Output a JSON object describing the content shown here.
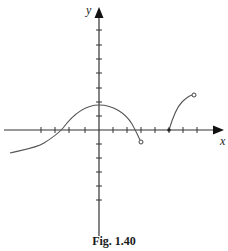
{
  "figure": {
    "caption": "Fig. 1.40",
    "x_axis_label": "x",
    "y_axis_label": "y",
    "colors": {
      "axis": "#333333",
      "curve": "#555555",
      "text": "#222222",
      "background": "#ffffff"
    },
    "origin_px": [
      99,
      130
    ],
    "tick_spacing_px": 14,
    "x_ticks_px": [
      41,
      55,
      69,
      85,
      113,
      127,
      141,
      155,
      169,
      183,
      197
    ],
    "y_ticks_px": [
      30,
      45,
      59,
      73,
      88,
      102,
      116,
      144,
      158,
      172,
      186,
      200
    ],
    "curve_segments": [
      {
        "name": "left-continuous-piece",
        "description": "Starts lower-left, rises through x-axis left of origin, peaks at y-axis, descends across x-axis and ends in an open circle below the axis",
        "start_endpoint": "none",
        "end_endpoint": "open-circle"
      },
      {
        "name": "right-piece",
        "description": "Starts at a closed dot on the x-axis and rises to an open circle in upper right",
        "start_endpoint": "closed-dot",
        "end_endpoint": "open-circle"
      }
    ]
  }
}
